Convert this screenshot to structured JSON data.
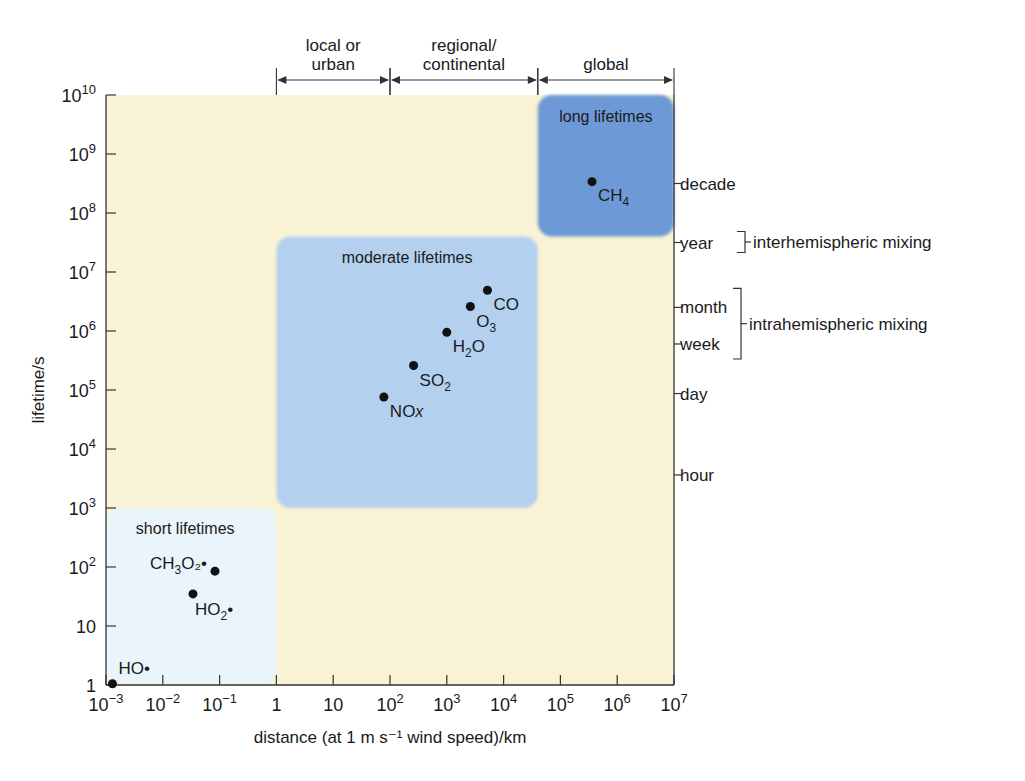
{
  "chart_data": {
    "type": "scatter",
    "title": "",
    "xlabel": "distance (at 1 m s⁻¹ wind speed)/km",
    "ylabel": "lifetime/s",
    "xscale": "log",
    "yscale": "log",
    "xlim": [
      0.001,
      10000000
    ],
    "ylim": [
      1,
      10000000000
    ],
    "grid": false,
    "legend": null,
    "x_ticks": [
      {
        "value": 0.001,
        "base": "10",
        "exp": "−3"
      },
      {
        "value": 0.01,
        "base": "10",
        "exp": "−2"
      },
      {
        "value": 0.1,
        "base": "10",
        "exp": "−1"
      },
      {
        "value": 1,
        "base": "1",
        "exp": ""
      },
      {
        "value": 10,
        "base": "10",
        "exp": ""
      },
      {
        "value": 100,
        "base": "10",
        "exp": "2"
      },
      {
        "value": 1000,
        "base": "10",
        "exp": "3"
      },
      {
        "value": 10000,
        "base": "10",
        "exp": "4"
      },
      {
        "value": 100000,
        "base": "10",
        "exp": "5"
      },
      {
        "value": 1000000,
        "base": "10",
        "exp": "6"
      },
      {
        "value": 10000000,
        "base": "10",
        "exp": "7"
      }
    ],
    "y_ticks": [
      {
        "value": 1,
        "base": "1",
        "exp": ""
      },
      {
        "value": 10,
        "base": "10",
        "exp": ""
      },
      {
        "value": 100,
        "base": "10",
        "exp": "2"
      },
      {
        "value": 1000,
        "base": "10",
        "exp": "3"
      },
      {
        "value": 10000,
        "base": "10",
        "exp": "4"
      },
      {
        "value": 100000,
        "base": "10",
        "exp": "5"
      },
      {
        "value": 1000000,
        "base": "10",
        "exp": "6"
      },
      {
        "value": 10000000,
        "base": "10",
        "exp": "7"
      },
      {
        "value": 100000000,
        "base": "10",
        "exp": "8"
      },
      {
        "value": 1000000000,
        "base": "10",
        "exp": "9"
      },
      {
        "value": 10000000000,
        "base": "10",
        "exp": "10"
      }
    ],
    "right_axis_labels": [
      {
        "label": "decade",
        "log_lifetime_s": 8.5
      },
      {
        "label": "year",
        "log_lifetime_s": 7.5
      },
      {
        "label": "month",
        "log_lifetime_s": 6.4
      },
      {
        "label": "week",
        "log_lifetime_s": 5.78
      },
      {
        "label": "day",
        "log_lifetime_s": 4.94
      },
      {
        "label": "hour",
        "log_lifetime_s": 3.56
      }
    ],
    "right_brackets": [
      {
        "label": "interhemispheric mixing",
        "spans": [
          "year"
        ]
      },
      {
        "label": "intrahemispheric mixing",
        "spans": [
          "month",
          "week"
        ]
      }
    ],
    "top_ranges": [
      {
        "label_lines": [
          "local or",
          "urban"
        ],
        "from": 1,
        "to": 100
      },
      {
        "label_lines": [
          "regional/",
          "continental"
        ],
        "from": 100,
        "to": 40000
      },
      {
        "label_lines": [
          "global"
        ],
        "from": 40000,
        "to": 10000000
      }
    ],
    "regions": [
      {
        "name": "short lifetimes",
        "x_from": 0.001,
        "x_to": 1,
        "y_from": 1,
        "y_to": 1000,
        "color": "#eaf4fb"
      },
      {
        "name": "moderate lifetimes",
        "x_from": 1,
        "x_to": 40000,
        "y_from": 1000,
        "y_to": 40000000,
        "color": "#b3d0ef"
      },
      {
        "name": "long lifetimes",
        "x_from": 40000,
        "x_to": 10000000,
        "y_from": 40000000,
        "y_to": 10000000000,
        "color": "#6d9ad6"
      }
    ],
    "series": [
      {
        "name": "species",
        "points": [
          {
            "label": "CH₄",
            "label_main": "CH",
            "label_sub": "4",
            "label_post": "",
            "x": 360000,
            "y": 340000000,
            "region": "long lifetimes"
          },
          {
            "label": "CO",
            "label_main": "CO",
            "label_sub": "",
            "label_post": "",
            "x": 5200,
            "y": 4900000,
            "region": "moderate lifetimes"
          },
          {
            "label": "O₃",
            "label_main": "O",
            "label_sub": "3",
            "label_post": "",
            "x": 2600,
            "y": 2600000,
            "region": "moderate lifetimes"
          },
          {
            "label": "H₂O",
            "label_main": "H",
            "label_sub": "2",
            "label_post": "O",
            "x": 1000,
            "y": 950000,
            "region": "moderate lifetimes"
          },
          {
            "label": "SO₂",
            "label_main": "SO",
            "label_sub": "2",
            "label_post": "",
            "x": 260,
            "y": 260000,
            "region": "moderate lifetimes"
          },
          {
            "label": "NOₓ",
            "label_main": "NO",
            "label_sub": "x",
            "label_post": "",
            "x": 78,
            "y": 76000,
            "region": "moderate lifetimes"
          },
          {
            "label": "CH₃O₂•",
            "label_main": "CH",
            "label_sub": "3",
            "label_post": "O₂•",
            "x": 0.083,
            "y": 85,
            "region": "short lifetimes"
          },
          {
            "label": "HO₂•",
            "label_main": "HO",
            "label_sub": "2",
            "label_post": "•",
            "x": 0.034,
            "y": 35,
            "region": "short lifetimes"
          },
          {
            "label": "HO•",
            "label_main": "HO•",
            "label_sub": "",
            "label_post": "",
            "x": 0.0013,
            "y": 1.05,
            "region": "short lifetimes"
          }
        ]
      }
    ]
  },
  "colors": {
    "background": "#faf2d4",
    "short_region": "#eaf4fb",
    "moderate_region": "#b3d0ef",
    "long_region": "#6d9ad6",
    "axis": "#333333",
    "text": "#1a1a1a",
    "marker": "#111111"
  }
}
